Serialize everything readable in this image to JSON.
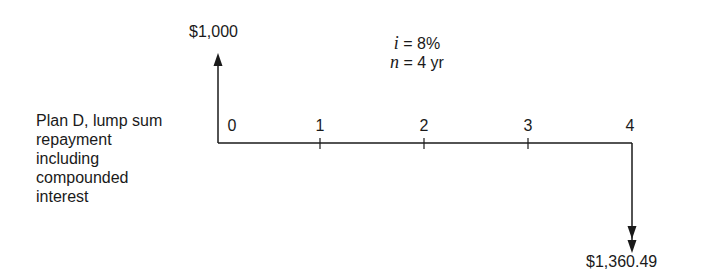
{
  "diagram": {
    "type": "cash-flow-diagram",
    "description_lines": [
      "Plan D, lump sum",
      "repayment",
      "including",
      "compounded",
      "interest"
    ],
    "parameters": {
      "rate_symbol": "i",
      "rate_value": "= 8%",
      "periods_symbol": "n",
      "periods_value": "= 4 yr"
    },
    "periods": [
      "0",
      "1",
      "2",
      "3",
      "4"
    ],
    "cash_flows": [
      {
        "period": "0",
        "direction": "up",
        "label": "$1,000"
      },
      {
        "period": "4",
        "direction": "down",
        "label": "$1,360.49"
      }
    ],
    "colors": {
      "line": "#1a1a1a",
      "background": "#ffffff"
    }
  }
}
